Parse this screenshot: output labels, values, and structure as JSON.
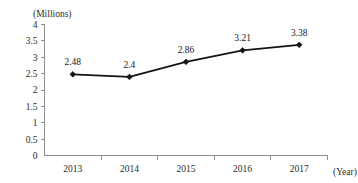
{
  "chart_data": {
    "type": "line",
    "title": "",
    "subtitle": "",
    "xlabel": "(Year)",
    "ylabel": "(Millions)",
    "categories": [
      "2013",
      "2014",
      "2015",
      "2016",
      "2017"
    ],
    "values": [
      2.48,
      2.4,
      2.86,
      3.21,
      3.38
    ],
    "point_labels": [
      "2.48",
      "2.4",
      "2.86",
      "3.21",
      "3.38"
    ],
    "series": [
      {
        "name": "",
        "values": [
          2.48,
          2.4,
          2.86,
          3.21,
          3.38
        ]
      }
    ],
    "ylim": [
      0,
      4
    ],
    "xlim_categories": 5,
    "ytick_values": [
      0,
      0.5,
      1,
      1.5,
      2,
      2.5,
      3,
      3.5,
      4
    ],
    "ytick_labels": [
      "0",
      "0.5",
      "1",
      "1.5",
      "2",
      "2.5",
      "3",
      "3.5",
      "4"
    ],
    "xtick_labels": [
      "2013",
      "2014",
      "2015",
      "2016",
      "2017"
    ],
    "grid": false,
    "legend": false,
    "legend_position": "none",
    "marker": "diamond",
    "line_color": "#141414",
    "axis_color": "#8d8d8d",
    "text_color": "#1a1a1a",
    "background_color": "#ffffff",
    "annotations": []
  },
  "axis": {
    "y_unit_label": "(Millions)",
    "x_unit_label": "(Year)"
  }
}
